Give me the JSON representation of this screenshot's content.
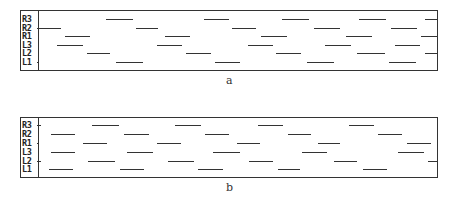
{
  "figure": {
    "panels": [
      {
        "id": "a",
        "caption": "a",
        "box": {
          "left": 20,
          "top": 10,
          "width": 418,
          "height": 61
        },
        "label_col_width": 17,
        "rows": [
          {
            "label": "R3",
            "y": 19,
            "segments": [
              [
                106,
                133
              ],
              [
                204,
                229
              ],
              [
                282,
                309
              ],
              [
                359,
                386
              ],
              [
                425,
                437
              ]
            ]
          },
          {
            "label": "R2",
            "y": 28,
            "segments": [
              [
                37,
                61
              ],
              [
                136,
                158
              ],
              [
                232,
                256
              ],
              [
                314,
                340
              ],
              [
                391,
                417
              ]
            ]
          },
          {
            "label": "R1",
            "y": 36,
            "segments": [
              [
                65,
                90
              ],
              [
                165,
                190
              ],
              [
                261,
                287
              ],
              [
                346,
                372
              ],
              [
                421,
                437
              ]
            ]
          },
          {
            "label": "L3",
            "y": 45,
            "segments": [
              [
                57,
                83
              ],
              [
                157,
                182
              ],
              [
                248,
                273
              ],
              [
                325,
                351
              ],
              [
                395,
                420
              ]
            ]
          },
          {
            "label": "L2",
            "y": 53,
            "segments": [
              [
                87,
                110
              ],
              [
                186,
                211
              ],
              [
                276,
                301
              ],
              [
                357,
                385
              ],
              [
                425,
                437
              ]
            ]
          },
          {
            "label": "L1",
            "y": 62,
            "segments": [
              [
                37,
                39
              ],
              [
                116,
                143
              ],
              [
                215,
                240
              ],
              [
                307,
                334
              ],
              [
                389,
                416
              ]
            ]
          }
        ]
      },
      {
        "id": "b",
        "caption": "b",
        "box": {
          "left": 20,
          "top": 117,
          "width": 418,
          "height": 61
        },
        "label_col_width": 17,
        "rows": [
          {
            "label": "R3",
            "y": 125,
            "segments": [
              [
                37,
                41
              ],
              [
                92,
                119
              ],
              [
                175,
                201
              ],
              [
                258,
                283
              ],
              [
                349,
                374
              ]
            ]
          },
          {
            "label": "R2",
            "y": 134,
            "segments": [
              [
                51,
                75
              ],
              [
                124,
                149
              ],
              [
                205,
                229
              ],
              [
                288,
                311
              ],
              [
                378,
                402
              ]
            ]
          },
          {
            "label": "R1",
            "y": 143,
            "segments": [
              [
                37,
                39
              ],
              [
                83,
                107
              ],
              [
                157,
                181
              ],
              [
                237,
                260
              ],
              [
                318,
                340
              ],
              [
                407,
                431
              ]
            ]
          },
          {
            "label": "L3",
            "y": 152,
            "segments": [
              [
                51,
                75
              ],
              [
                127,
                153
              ],
              [
                213,
                240
              ],
              [
                302,
                327
              ],
              [
                398,
                424
              ]
            ]
          },
          {
            "label": "L2",
            "y": 161,
            "segments": [
              [
                37,
                41
              ],
              [
                88,
                115
              ],
              [
                168,
                194
              ],
              [
                249,
                273
              ],
              [
                334,
                357
              ],
              [
                428,
                437
              ]
            ]
          },
          {
            "label": "L1",
            "y": 169,
            "segments": [
              [
                49,
                73
              ],
              [
                120,
                144
              ],
              [
                198,
                223
              ],
              [
                278,
                300
              ],
              [
                363,
                387
              ]
            ]
          }
        ]
      }
    ]
  }
}
